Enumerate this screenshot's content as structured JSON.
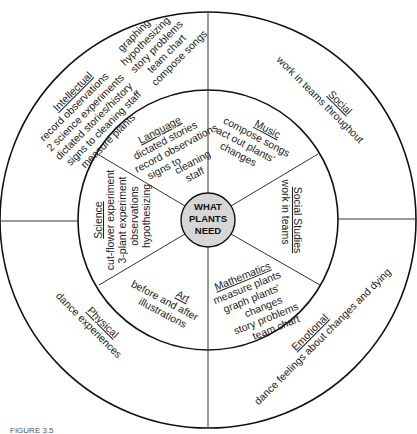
{
  "figure_caption": "FIGURE 3.5",
  "hub": {
    "lines": [
      "WHAT",
      "PLANTS",
      "NEED"
    ],
    "fill": "#d6d6d6"
  },
  "inner_ring": {
    "language": {
      "title": "Language",
      "lines": [
        "dictated stories",
        "record observations",
        "signs to",
        "cleaning",
        "staff"
      ]
    },
    "music": {
      "title": "Music",
      "lines": [
        "compose songs",
        "act out plants'",
        "changes"
      ]
    },
    "social_studies": {
      "title": "Social Studies",
      "lines": [
        "work in teams"
      ]
    },
    "mathematics": {
      "title": "Mathematics",
      "lines": [
        "measure plants",
        "graph plants'",
        "changes",
        "story problems",
        "team chart"
      ]
    },
    "art": {
      "title": "Art",
      "lines": [
        "before and after",
        "illustrations"
      ]
    },
    "science": {
      "title": "Science",
      "lines": [
        "cut-flower experiment",
        "3-plant experiment",
        "observations",
        "hypothesizing"
      ]
    }
  },
  "outer_ring": {
    "intellectual": {
      "title": "Intellectual",
      "lines": [
        "record observations",
        "2 science experiments",
        "dictated stories/history",
        "signs to cleaning staff",
        "measure plants"
      ],
      "lines2": [
        "graphing",
        "hypothesizing",
        "story problems",
        "team chart",
        "compose songs"
      ]
    },
    "social": {
      "title": "Social",
      "lines": [
        "work in teams throughout"
      ]
    },
    "emotional": {
      "title": "Emotional",
      "lines": [
        "dance feelings about changes and dying"
      ]
    },
    "physical": {
      "title": "Physical",
      "lines": [
        "dance experiences"
      ]
    }
  }
}
